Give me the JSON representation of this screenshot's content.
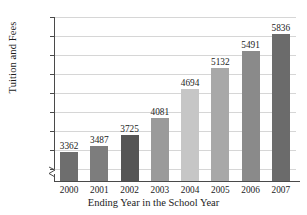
{
  "chart_data": {
    "type": "bar",
    "title": "",
    "xlabel": "Ending Year in the School Year",
    "ylabel": "Tuition and Fees",
    "categories": [
      "2000",
      "2001",
      "2002",
      "2003",
      "2004",
      "2005",
      "2006",
      "2007"
    ],
    "values": [
      3362,
      3487,
      3725,
      4081,
      4694,
      5132,
      5491,
      5836
    ],
    "value_labels": [
      "3362",
      "3487",
      "3725",
      "4081",
      "4694",
      "5132",
      "5491",
      "5836"
    ],
    "ylim": [
      3000,
      6200
    ],
    "ytick_step": 400,
    "ytick_labels": [
      "$6200",
      "$5800",
      "$5400",
      "$5000",
      "$4600",
      "$4200",
      "$3800",
      "$3400",
      "$3000"
    ],
    "ytick_values": [
      6200,
      5800,
      5400,
      5000,
      4600,
      4200,
      3800,
      3400,
      3000
    ],
    "grid": true,
    "axis_break": true,
    "legend": "none",
    "bar_colors": [
      "#6e6e6e",
      "#7d7d7d",
      "#555555",
      "#9a9a9a",
      "#c6c6c6",
      "#a8a8a8",
      "#8a8a8a",
      "#6b6b6b"
    ],
    "grid_color": "#d6d6d6",
    "axis_color": "#4a4a4a",
    "text_color": "#1b1b1b"
  }
}
